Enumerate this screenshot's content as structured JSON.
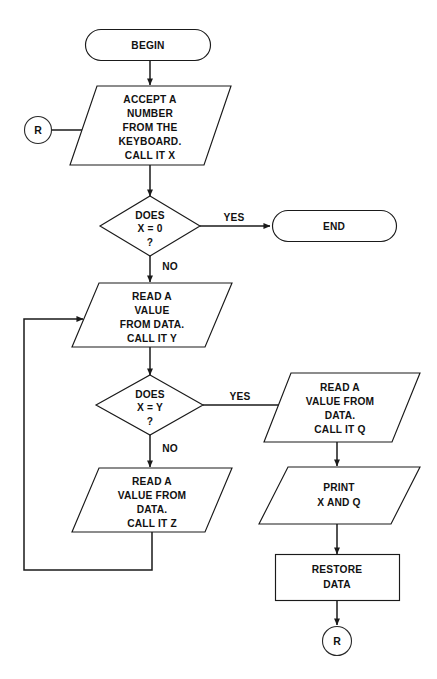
{
  "diagram": {
    "type": "flowchart",
    "background_color": "#ffffff",
    "line_color": "#1a1a1a",
    "text_color": "#111111",
    "canvas": {
      "width": 437,
      "height": 679
    }
  },
  "nodes": {
    "begin": {
      "shape": "terminator",
      "label": "BEGIN",
      "lines": [
        "BEGIN"
      ]
    },
    "connector_in": {
      "shape": "connector-circle",
      "label": "R"
    },
    "accept_number": {
      "shape": "parallelogram",
      "lines": [
        "ACCEPT A",
        "NUMBER",
        "FROM THE",
        "KEYBOARD.",
        "CALL IT X"
      ]
    },
    "decide_x_zero": {
      "shape": "diamond",
      "lines": [
        "DOES",
        "X = 0",
        "?"
      ]
    },
    "end": {
      "shape": "terminator",
      "label": "END",
      "lines": [
        "END"
      ]
    },
    "read_y": {
      "shape": "parallelogram",
      "lines": [
        "READ A",
        "VALUE",
        "FROM DATA.",
        "CALL IT Y"
      ]
    },
    "decide_x_eq_y": {
      "shape": "diamond",
      "lines": [
        "DOES",
        "X = Y",
        "?"
      ]
    },
    "read_z": {
      "shape": "parallelogram",
      "lines": [
        "READ A",
        "VALUE FROM",
        "DATA.",
        "CALL IT Z"
      ]
    },
    "read_q": {
      "shape": "parallelogram",
      "lines": [
        "READ A",
        "VALUE FROM",
        "DATA.",
        "CALL IT Q"
      ]
    },
    "print_xq": {
      "shape": "parallelogram",
      "lines": [
        "PRINT",
        "X AND Q"
      ]
    },
    "restore_data": {
      "shape": "process-rect",
      "lines": [
        "RESTORE",
        "DATA"
      ]
    },
    "connector_out": {
      "shape": "connector-circle",
      "label": "R"
    }
  },
  "edge_labels": {
    "x_zero_yes": "YES",
    "x_zero_no": "NO",
    "x_eq_y_yes": "YES",
    "x_eq_y_no": "NO"
  }
}
